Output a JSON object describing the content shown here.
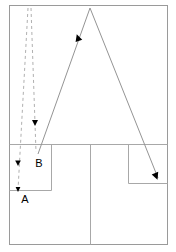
{
  "diagram": {
    "background_color": "#ffffff",
    "stroke_color": "#8c8c8c",
    "marker_color": "#000000",
    "label_color": "#000000",
    "labels": [
      {
        "id": "label-a",
        "text": "A",
        "x": 25,
        "y": 203
      },
      {
        "id": "label-b",
        "text": "B",
        "x": 39,
        "y": 167
      }
    ],
    "frames": {
      "outer": {
        "x": 9,
        "y": 5,
        "width": 159,
        "height": 240
      },
      "inner_top_divider_y": 144,
      "inner_vertical_divider_x": 90,
      "left_box": {
        "x": 9,
        "y": 144,
        "width": 42,
        "height": 46
      },
      "right_box": {
        "x": 128,
        "y": 144,
        "width": 40,
        "height": 39
      }
    },
    "solid_path": {
      "name": "solid-trajectory",
      "points": "38,154 90,8 158,178",
      "apex": {
        "x": 90,
        "y": 8
      },
      "start": {
        "x": 38,
        "y": 154
      },
      "end": {
        "x": 158,
        "y": 178
      }
    },
    "dashed_paths": [
      {
        "name": "dashed-trajectory-left",
        "points": "28,8 18,190"
      },
      {
        "name": "dashed-trajectory-right",
        "points": "31,8 36,152"
      }
    ],
    "markers": [
      {
        "name": "marker-ascending",
        "x": 78,
        "y": 38,
        "type": "arrowhead-up"
      },
      {
        "name": "marker-descending",
        "x": 156,
        "y": 176,
        "type": "arrowhead-down"
      },
      {
        "name": "marker-dashed-right",
        "x": 35,
        "y": 123,
        "type": "arrowhead-down"
      },
      {
        "name": "marker-dashed-left",
        "x": 18,
        "y": 163,
        "type": "arrowhead-down"
      },
      {
        "name": "marker-a-tip",
        "x": 18,
        "y": 190,
        "type": "arrowhead-down"
      }
    ]
  }
}
